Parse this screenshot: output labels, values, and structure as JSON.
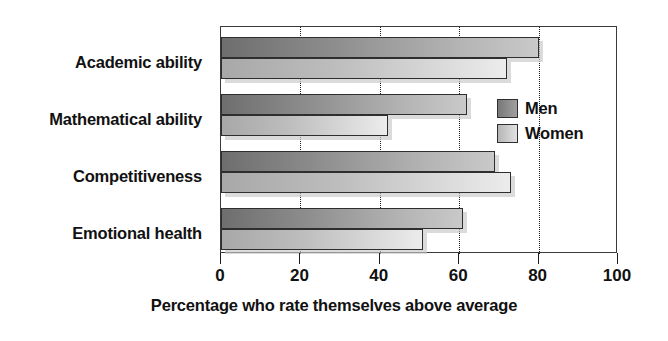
{
  "chart_data": {
    "type": "bar",
    "orientation": "horizontal",
    "title": "",
    "xlabel": "Percentage who rate themselves above average",
    "ylabel": "",
    "xlim": [
      0,
      100
    ],
    "xticks": [
      0,
      20,
      40,
      60,
      80,
      100
    ],
    "xtick_labels": [
      "0",
      "20",
      "40",
      "60",
      "80",
      "100"
    ],
    "grid": "vertical-dotted",
    "legend_position": "inside-right",
    "categories": [
      "Academic ability",
      "Mathematical ability",
      "Competitiveness",
      "Emotional health"
    ],
    "series": [
      {
        "name": "Men",
        "color": "#8d8d8d",
        "values": [
          80,
          62,
          69,
          61
        ]
      },
      {
        "name": "Women",
        "color": "#d0d0d0",
        "values": [
          72,
          42,
          73,
          51
        ]
      }
    ]
  },
  "legend": {
    "items": [
      {
        "label": "Men",
        "key": "men"
      },
      {
        "label": "Women",
        "key": "women"
      }
    ]
  }
}
